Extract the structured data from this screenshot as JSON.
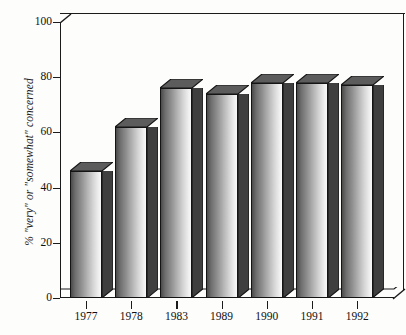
{
  "chart_data": {
    "type": "bar",
    "title": "",
    "subtitle": "",
    "xlabel": "",
    "ylabel": "% \"very\" or \"somewhat\" concerned",
    "categories": [
      "1977",
      "1978",
      "1983",
      "1989",
      "1990",
      "1991",
      "1992"
    ],
    "values": [
      46,
      62,
      76,
      74,
      78,
      78,
      77
    ],
    "series": [
      {
        "name": "% \"very\" or \"somewhat\" concerned",
        "values": [
          46,
          62,
          76,
          74,
          78,
          78,
          77
        ]
      }
    ],
    "ylim": [
      0,
      100
    ],
    "ytick_labels": [
      "0",
      "20",
      "40",
      "60",
      "80",
      "100"
    ],
    "ytick_values": [
      0,
      20,
      40,
      60,
      80,
      100
    ],
    "grid": false,
    "legend": false,
    "legend_position": "none",
    "style": "3d-bar",
    "annotations": []
  },
  "colors": {
    "axis": "#1b1b1b",
    "text": "#101010",
    "bar_dark": "#4a4a4a",
    "bar_light": "#f7f7f7",
    "bar_top": "#5c5c5c",
    "bar_side": "#3f3f3f",
    "background": "#fdfdfc"
  }
}
